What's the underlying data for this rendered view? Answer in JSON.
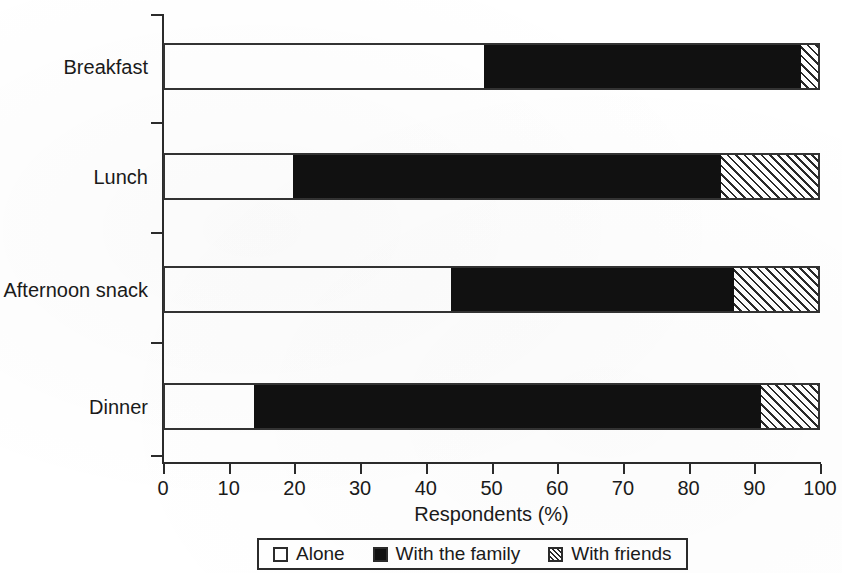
{
  "chart_data": {
    "type": "bar",
    "orientation": "horizontal",
    "stacked": true,
    "title": "",
    "xlabel": "Respondents (%)",
    "ylabel": "",
    "xlim": [
      0,
      100
    ],
    "xticks": [
      "0",
      "10",
      "20",
      "30",
      "40",
      "50",
      "60",
      "70",
      "80",
      "90",
      "100"
    ],
    "grid": false,
    "legend_position": "bottom",
    "categories": [
      "Breakfast",
      "Lunch",
      "Afternoon snack",
      "Dinner"
    ],
    "series": [
      {
        "name": "Alone",
        "pattern": "open",
        "values": [
          48.9,
          19.8,
          43.8,
          13.8
        ]
      },
      {
        "name": "With the family",
        "pattern": "solid-black",
        "values": [
          48.2,
          65.2,
          43.1,
          77.2
        ]
      },
      {
        "name": "With friends",
        "pattern": "hatched",
        "values": [
          2.9,
          15.0,
          13.1,
          9.0
        ]
      }
    ],
    "cumulative_boundaries": [
      {
        "category": "Breakfast",
        "alone_end": 48.9,
        "family_end": 97.1,
        "friends_end": 100
      },
      {
        "category": "Lunch",
        "alone_end": 19.8,
        "family_end": 85.0,
        "friends_end": 100
      },
      {
        "category": "Afternoon snack",
        "alone_end": 43.8,
        "family_end": 86.9,
        "friends_end": 100
      },
      {
        "category": "Dinner",
        "alone_end": 13.8,
        "family_end": 91.0,
        "friends_end": 100
      }
    ],
    "colors": {
      "alone": "#ffffff",
      "family": "#111111",
      "friends": "#ffffff",
      "outline": "#333333",
      "text": "#1a1a1a"
    }
  },
  "axis": {
    "x_title": "Respondents (%)"
  },
  "legend": {
    "items": [
      {
        "label": "Alone",
        "swatch": "open-square-swatch"
      },
      {
        "label": "With the family",
        "swatch": "filled-square-swatch"
      },
      {
        "label": "With friends",
        "swatch": "hatched-square-swatch"
      }
    ]
  }
}
